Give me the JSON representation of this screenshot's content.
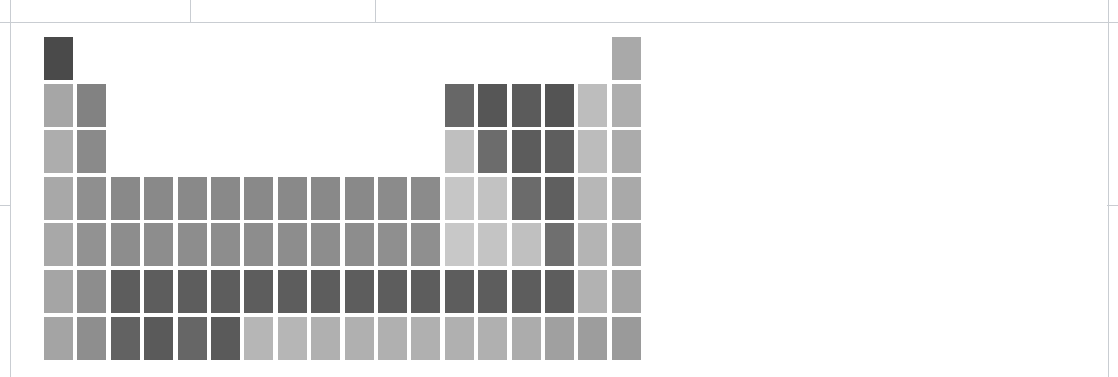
{
  "figure": {
    "kind": "periodic-table-heatmap",
    "background_color": "#ffffff"
  },
  "rules": [
    {
      "name": "page-border-left",
      "orientation": "v",
      "x": 10,
      "y": 0,
      "length": 377
    },
    {
      "name": "page-border-right",
      "orientation": "v",
      "x": 1108,
      "y": 0,
      "length": 377
    },
    {
      "name": "table-header-divider-1",
      "orientation": "v",
      "x": 190,
      "y": 0,
      "length": 22
    },
    {
      "name": "table-header-divider-2",
      "orientation": "v",
      "x": 375,
      "y": 0,
      "length": 22
    },
    {
      "name": "table-top-rule",
      "orientation": "h",
      "x": 0,
      "y": 22,
      "length": 1118
    },
    {
      "name": "left-margin-tick",
      "orientation": "h",
      "x": 0,
      "y": 205,
      "length": 11
    },
    {
      "name": "right-margin-tick",
      "orientation": "h",
      "x": 1107,
      "y": 205,
      "length": 11
    }
  ],
  "grid": {
    "origin_x": 44,
    "origin_y": 37,
    "col_pitch": 33.4,
    "row_pitch": 46.6,
    "cell_width": 29,
    "cell_height": 43,
    "columns": 18,
    "rows": 7
  },
  "color_scale": {
    "type": "sequential-grayscale",
    "light": "#d0d0d0",
    "mid": "#8a8a8a",
    "dark": "#4a4a4a"
  },
  "chart_data": {
    "type": "heatmap",
    "title": "",
    "xlabel": "",
    "ylabel": "",
    "legend": "",
    "grid": false,
    "x": [
      "1",
      "2",
      "3",
      "4",
      "5",
      "6",
      "7",
      "8",
      "9",
      "10",
      "11",
      "12",
      "13",
      "14",
      "15",
      "16",
      "17",
      "18"
    ],
    "y": [
      "1",
      "2",
      "3",
      "4",
      "5",
      "6",
      "7"
    ],
    "cells": [
      {
        "symbol": "H",
        "group": 1,
        "period": 1,
        "color": "#4a4a4a"
      },
      {
        "symbol": "He",
        "group": 18,
        "period": 1,
        "color": "#a9a9a9"
      },
      {
        "symbol": "Li",
        "group": 1,
        "period": 2,
        "color": "#a6a6a6"
      },
      {
        "symbol": "Be",
        "group": 2,
        "period": 2,
        "color": "#828282"
      },
      {
        "symbol": "B",
        "group": 13,
        "period": 2,
        "color": "#676767"
      },
      {
        "symbol": "C",
        "group": 14,
        "period": 2,
        "color": "#565656"
      },
      {
        "symbol": "N",
        "group": 15,
        "period": 2,
        "color": "#5b5b5b"
      },
      {
        "symbol": "O",
        "group": 16,
        "period": 2,
        "color": "#545454"
      },
      {
        "symbol": "F",
        "group": 17,
        "period": 2,
        "color": "#bdbdbd"
      },
      {
        "symbol": "Ne",
        "group": 18,
        "period": 2,
        "color": "#aeaeae"
      },
      {
        "symbol": "Na",
        "group": 1,
        "period": 3,
        "color": "#adadad"
      },
      {
        "symbol": "Mg",
        "group": 2,
        "period": 3,
        "color": "#8a8a8a"
      },
      {
        "symbol": "Al",
        "group": 13,
        "period": 3,
        "color": "#bfbfbf"
      },
      {
        "symbol": "Si",
        "group": 14,
        "period": 3,
        "color": "#6c6c6c"
      },
      {
        "symbol": "P",
        "group": 15,
        "period": 3,
        "color": "#5c5c5c"
      },
      {
        "symbol": "S",
        "group": 16,
        "period": 3,
        "color": "#5e5e5e"
      },
      {
        "symbol": "Cl",
        "group": 17,
        "period": 3,
        "color": "#bcbcbc"
      },
      {
        "symbol": "Ar",
        "group": 18,
        "period": 3,
        "color": "#ababab"
      },
      {
        "symbol": "K",
        "group": 1,
        "period": 4,
        "color": "#a8a8a8"
      },
      {
        "symbol": "Ca",
        "group": 2,
        "period": 4,
        "color": "#8f8f8f"
      },
      {
        "symbol": "Sc",
        "group": 3,
        "period": 4,
        "color": "#898989"
      },
      {
        "symbol": "Ti",
        "group": 4,
        "period": 4,
        "color": "#898989"
      },
      {
        "symbol": "V",
        "group": 5,
        "period": 4,
        "color": "#898989"
      },
      {
        "symbol": "Cr",
        "group": 6,
        "period": 4,
        "color": "#898989"
      },
      {
        "symbol": "Mn",
        "group": 7,
        "period": 4,
        "color": "#898989"
      },
      {
        "symbol": "Fe",
        "group": 8,
        "period": 4,
        "color": "#898989"
      },
      {
        "symbol": "Co",
        "group": 9,
        "period": 4,
        "color": "#898989"
      },
      {
        "symbol": "Ni",
        "group": 10,
        "period": 4,
        "color": "#898989"
      },
      {
        "symbol": "Cu",
        "group": 11,
        "period": 4,
        "color": "#8b8b8b"
      },
      {
        "symbol": "Zn",
        "group": 12,
        "period": 4,
        "color": "#8b8b8b"
      },
      {
        "symbol": "Ga",
        "group": 13,
        "period": 4,
        "color": "#c6c6c6"
      },
      {
        "symbol": "Ge",
        "group": 14,
        "period": 4,
        "color": "#c2c2c2"
      },
      {
        "symbol": "As",
        "group": 15,
        "period": 4,
        "color": "#6b6b6b"
      },
      {
        "symbol": "Se",
        "group": 16,
        "period": 4,
        "color": "#5f5f5f"
      },
      {
        "symbol": "Br",
        "group": 17,
        "period": 4,
        "color": "#b7b7b7"
      },
      {
        "symbol": "Kr",
        "group": 18,
        "period": 4,
        "color": "#a9a9a9"
      },
      {
        "symbol": "Rb",
        "group": 1,
        "period": 5,
        "color": "#a8a8a8"
      },
      {
        "symbol": "Sr",
        "group": 2,
        "period": 5,
        "color": "#929292"
      },
      {
        "symbol": "Y",
        "group": 3,
        "period": 5,
        "color": "#8d8d8d"
      },
      {
        "symbol": "Zr",
        "group": 4,
        "period": 5,
        "color": "#8d8d8d"
      },
      {
        "symbol": "Nb",
        "group": 5,
        "period": 5,
        "color": "#8d8d8d"
      },
      {
        "symbol": "Mo",
        "group": 6,
        "period": 5,
        "color": "#8d8d8d"
      },
      {
        "symbol": "Tc",
        "group": 7,
        "period": 5,
        "color": "#8d8d8d"
      },
      {
        "symbol": "Ru",
        "group": 8,
        "period": 5,
        "color": "#8d8d8d"
      },
      {
        "symbol": "Rh",
        "group": 9,
        "period": 5,
        "color": "#8d8d8d"
      },
      {
        "symbol": "Pd",
        "group": 10,
        "period": 5,
        "color": "#8d8d8d"
      },
      {
        "symbol": "Ag",
        "group": 11,
        "period": 5,
        "color": "#8f8f8f"
      },
      {
        "symbol": "Cd",
        "group": 12,
        "period": 5,
        "color": "#8f8f8f"
      },
      {
        "symbol": "In",
        "group": 13,
        "period": 5,
        "color": "#c8c8c8"
      },
      {
        "symbol": "Sn",
        "group": 14,
        "period": 5,
        "color": "#c4c4c4"
      },
      {
        "symbol": "Sb",
        "group": 15,
        "period": 5,
        "color": "#c0c0c0"
      },
      {
        "symbol": "Te",
        "group": 16,
        "period": 5,
        "color": "#6f6f6f"
      },
      {
        "symbol": "I",
        "group": 17,
        "period": 5,
        "color": "#b4b4b4"
      },
      {
        "symbol": "Xe",
        "group": 18,
        "period": 5,
        "color": "#a8a8a8"
      },
      {
        "symbol": "Cs",
        "group": 1,
        "period": 6,
        "color": "#a5a5a5"
      },
      {
        "symbol": "Ba",
        "group": 2,
        "period": 6,
        "color": "#8d8d8d"
      },
      {
        "symbol": "La",
        "group": 3,
        "period": 6,
        "color": "#5d5d5d"
      },
      {
        "symbol": "Hf",
        "group": 4,
        "period": 6,
        "color": "#5d5d5d"
      },
      {
        "symbol": "Ta",
        "group": 5,
        "period": 6,
        "color": "#5d5d5d"
      },
      {
        "symbol": "W",
        "group": 6,
        "period": 6,
        "color": "#5d5d5d"
      },
      {
        "symbol": "Re",
        "group": 7,
        "period": 6,
        "color": "#5d5d5d"
      },
      {
        "symbol": "Os",
        "group": 8,
        "period": 6,
        "color": "#5d5d5d"
      },
      {
        "symbol": "Ir",
        "group": 9,
        "period": 6,
        "color": "#5d5d5d"
      },
      {
        "symbol": "Pt",
        "group": 10,
        "period": 6,
        "color": "#5d5d5d"
      },
      {
        "symbol": "Au",
        "group": 11,
        "period": 6,
        "color": "#5d5d5d"
      },
      {
        "symbol": "Hg",
        "group": 12,
        "period": 6,
        "color": "#5d5d5d"
      },
      {
        "symbol": "Tl",
        "group": 13,
        "period": 6,
        "color": "#5d5d5d"
      },
      {
        "symbol": "Pb",
        "group": 14,
        "period": 6,
        "color": "#5d5d5d"
      },
      {
        "symbol": "Bi",
        "group": 15,
        "period": 6,
        "color": "#5d5d5d"
      },
      {
        "symbol": "Po",
        "group": 16,
        "period": 6,
        "color": "#5d5d5d"
      },
      {
        "symbol": "At",
        "group": 17,
        "period": 6,
        "color": "#b2b2b2"
      },
      {
        "symbol": "Rn",
        "group": 18,
        "period": 6,
        "color": "#a4a4a4"
      },
      {
        "symbol": "Fr",
        "group": 1,
        "period": 7,
        "color": "#a4a4a4"
      },
      {
        "symbol": "Ra",
        "group": 2,
        "period": 7,
        "color": "#8e8e8e"
      },
      {
        "symbol": "Ac",
        "group": 3,
        "period": 7,
        "color": "#626262"
      },
      {
        "symbol": "Rf",
        "group": 4,
        "period": 7,
        "color": "#5a5a5a"
      },
      {
        "symbol": "Db",
        "group": 5,
        "period": 7,
        "color": "#666666"
      },
      {
        "symbol": "Sg",
        "group": 6,
        "period": 7,
        "color": "#5a5a5a"
      },
      {
        "symbol": "Bh",
        "group": 7,
        "period": 7,
        "color": "#b6b6b6"
      },
      {
        "symbol": "Hs",
        "group": 8,
        "period": 7,
        "color": "#b6b6b6"
      },
      {
        "symbol": "Mt",
        "group": 9,
        "period": 7,
        "color": "#b0b0b0"
      },
      {
        "symbol": "Ds",
        "group": 10,
        "period": 7,
        "color": "#b0b0b0"
      },
      {
        "symbol": "Rg",
        "group": 11,
        "period": 7,
        "color": "#b0b0b0"
      },
      {
        "symbol": "Cn",
        "group": 12,
        "period": 7,
        "color": "#b0b0b0"
      },
      {
        "symbol": "Nh",
        "group": 13,
        "period": 7,
        "color": "#b0b0b0"
      },
      {
        "symbol": "Fl",
        "group": 14,
        "period": 7,
        "color": "#b0b0b0"
      },
      {
        "symbol": "Mc",
        "group": 15,
        "period": 7,
        "color": "#acacac"
      },
      {
        "symbol": "Lv",
        "group": 16,
        "period": 7,
        "color": "#a0a0a0"
      },
      {
        "symbol": "Ts",
        "group": 17,
        "period": 7,
        "color": "#9d9d9d"
      },
      {
        "symbol": "Og",
        "group": 18,
        "period": 7,
        "color": "#9a9a9a"
      }
    ]
  }
}
